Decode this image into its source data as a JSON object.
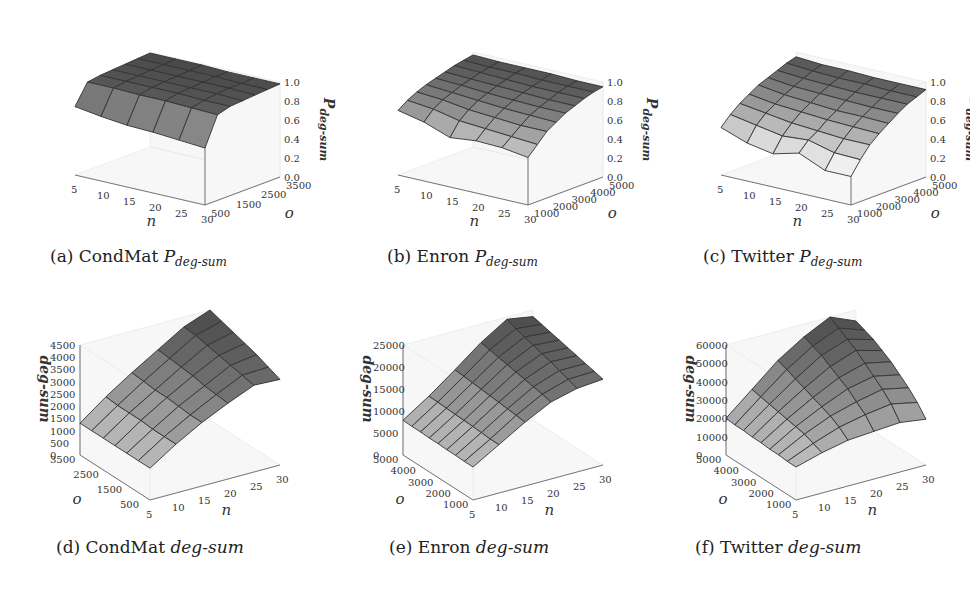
{
  "figure": {
    "panels": [
      {
        "id": "a",
        "caption_prefix": "(a) CondMat ",
        "caption_var": "P",
        "caption_sub": "deg-sum"
      },
      {
        "id": "b",
        "caption_prefix": "(b) Enron ",
        "caption_var": "P",
        "caption_sub": "deg-sum"
      },
      {
        "id": "c",
        "caption_prefix": "(c) Twitter ",
        "caption_var": "P",
        "caption_sub": "deg-sum"
      },
      {
        "id": "d",
        "caption_prefix": "(d) CondMat ",
        "caption_var": "deg-sum",
        "caption_sub": ""
      },
      {
        "id": "e",
        "caption_prefix": "(e) Enron ",
        "caption_var": "deg-sum",
        "caption_sub": ""
      },
      {
        "id": "f",
        "caption_prefix": "(f) Twitter ",
        "caption_var": "deg-sum",
        "caption_sub": ""
      }
    ]
  },
  "chart_data": [
    {
      "type": "surface3d",
      "title": "(a) CondMat P_deg-sum",
      "xlabel": "n",
      "ylabel": "o",
      "zlabel": "P_deg-sum",
      "x_ticks": [
        "5",
        "10",
        "15",
        "20",
        "25",
        "30"
      ],
      "y_ticks": [
        "500",
        "1500",
        "2500",
        "3500"
      ],
      "z_ticks": [
        "0.0",
        "0.2",
        "0.4",
        "0.6",
        "0.8",
        "1.0"
      ],
      "zlim": [
        0,
        1
      ],
      "x": [
        5,
        10,
        15,
        20,
        25,
        30
      ],
      "y": [
        500,
        1000,
        1500,
        2000,
        2500,
        3000,
        3500
      ],
      "z": [
        [
          0.72,
          0.68,
          0.65,
          0.64,
          0.62,
          0.6
        ],
        [
          0.93,
          0.93,
          0.92,
          0.92,
          0.91,
          0.9
        ],
        [
          0.95,
          0.95,
          0.95,
          0.95,
          0.94,
          0.94
        ],
        [
          0.96,
          0.96,
          0.96,
          0.96,
          0.96,
          0.95
        ],
        [
          0.97,
          0.97,
          0.97,
          0.97,
          0.97,
          0.96
        ],
        [
          0.98,
          0.98,
          0.98,
          0.98,
          0.97,
          0.97
        ],
        [
          0.99,
          0.99,
          0.99,
          0.98,
          0.98,
          0.98
        ]
      ]
    },
    {
      "type": "surface3d",
      "title": "(b) Enron P_deg-sum",
      "xlabel": "n",
      "ylabel": "o",
      "zlabel": "P_deg-sum",
      "x_ticks": [
        "5",
        "10",
        "15",
        "20",
        "25",
        "30"
      ],
      "y_ticks": [
        "1000",
        "2000",
        "3000",
        "4000",
        "5000"
      ],
      "z_ticks": [
        "0.0",
        "0.2",
        "0.4",
        "0.6",
        "0.8",
        "1.0"
      ],
      "zlim": [
        0,
        1
      ],
      "x": [
        5,
        10,
        15,
        20,
        25,
        30
      ],
      "y": [
        1000,
        1500,
        2000,
        2500,
        3000,
        3500,
        4000,
        4500,
        5000
      ],
      "z": [
        [
          0.68,
          0.62,
          0.52,
          0.55,
          0.54,
          0.5
        ],
        [
          0.75,
          0.72,
          0.66,
          0.64,
          0.62,
          0.6
        ],
        [
          0.8,
          0.78,
          0.74,
          0.72,
          0.7,
          0.7
        ],
        [
          0.84,
          0.82,
          0.8,
          0.78,
          0.77,
          0.76
        ],
        [
          0.87,
          0.86,
          0.84,
          0.83,
          0.82,
          0.82
        ],
        [
          0.9,
          0.89,
          0.88,
          0.87,
          0.86,
          0.86
        ],
        [
          0.93,
          0.92,
          0.91,
          0.9,
          0.9,
          0.9
        ],
        [
          0.95,
          0.94,
          0.94,
          0.93,
          0.93,
          0.93
        ],
        [
          0.97,
          0.96,
          0.96,
          0.96,
          0.95,
          0.95
        ]
      ]
    },
    {
      "type": "surface3d",
      "title": "(c) Twitter P_deg-sum",
      "xlabel": "n",
      "ylabel": "o",
      "zlabel": "P_deg-sum",
      "x_ticks": [
        "5",
        "10",
        "15",
        "20",
        "25",
        "30"
      ],
      "y_ticks": [
        "1000",
        "2000",
        "3000",
        "4000",
        "5000"
      ],
      "z_ticks": [
        "0.0",
        "0.2",
        "0.4",
        "0.6",
        "0.8",
        "1.0"
      ],
      "zlim": [
        0,
        1
      ],
      "x": [
        5,
        10,
        15,
        20,
        25,
        30
      ],
      "y": [
        1000,
        1500,
        2000,
        2500,
        3000,
        3500,
        4000,
        4500,
        5000
      ],
      "z": [
        [
          0.5,
          0.4,
          0.35,
          0.42,
          0.3,
          0.3
        ],
        [
          0.6,
          0.55,
          0.5,
          0.52,
          0.45,
          0.44
        ],
        [
          0.68,
          0.64,
          0.6,
          0.58,
          0.56,
          0.56
        ],
        [
          0.74,
          0.7,
          0.68,
          0.66,
          0.65,
          0.64
        ],
        [
          0.8,
          0.76,
          0.74,
          0.72,
          0.72,
          0.71
        ],
        [
          0.84,
          0.81,
          0.8,
          0.79,
          0.78,
          0.78
        ],
        [
          0.88,
          0.86,
          0.85,
          0.84,
          0.84,
          0.84
        ],
        [
          0.92,
          0.9,
          0.89,
          0.89,
          0.88,
          0.88
        ],
        [
          0.95,
          0.93,
          0.93,
          0.92,
          0.92,
          0.92
        ]
      ]
    },
    {
      "type": "surface3d",
      "title": "(d) CondMat deg-sum",
      "xlabel": "n",
      "ylabel": "o",
      "zlabel": "deg-sum",
      "x_ticks": [
        "5",
        "10",
        "15",
        "20",
        "25",
        "30"
      ],
      "y_ticks": [
        "500",
        "1500",
        "2500",
        "3500"
      ],
      "z_ticks": [
        "0",
        "500",
        "1000",
        "1500",
        "2000",
        "2500",
        "3000",
        "3500",
        "4000",
        "4500"
      ],
      "zlim": [
        0,
        4500
      ],
      "x": [
        5,
        10,
        15,
        20,
        25,
        30
      ],
      "y": [
        500,
        1000,
        1500,
        2000,
        2500,
        3000,
        3500
      ],
      "z": [
        [
          1300,
          2000,
          2600,
          3100,
          3550,
          3500
        ],
        [
          1300,
          2000,
          2600,
          3150,
          3650,
          3700
        ],
        [
          1300,
          2000,
          2650,
          3200,
          3750,
          3900
        ],
        [
          1300,
          2050,
          2700,
          3300,
          3850,
          4050
        ],
        [
          1300,
          2050,
          2700,
          3350,
          3950,
          4200
        ],
        [
          1300,
          2050,
          2750,
          3400,
          4050,
          4350
        ],
        [
          1300,
          2100,
          2800,
          3450,
          4100,
          4500
        ]
      ]
    },
    {
      "type": "surface3d",
      "title": "(e) Enron deg-sum",
      "xlabel": "n",
      "ylabel": "o",
      "zlabel": "deg-sum",
      "x_ticks": [
        "5",
        "10",
        "15",
        "20",
        "25",
        "30"
      ],
      "y_ticks": [
        "1000",
        "2000",
        "3000",
        "4000",
        "5000"
      ],
      "z_ticks": [
        "0",
        "5000",
        "10000",
        "15000",
        "20000",
        "25000"
      ],
      "zlim": [
        0,
        25000
      ],
      "x": [
        5,
        10,
        15,
        20,
        25,
        30
      ],
      "y": [
        1000,
        1500,
        2000,
        2500,
        3000,
        3500,
        4000,
        4500,
        5000
      ],
      "z": [
        [
          7500,
          11000,
          14500,
          17500,
          19000,
          19500
        ],
        [
          7500,
          11000,
          14800,
          18000,
          19800,
          20000
        ],
        [
          7600,
          11200,
          15000,
          18400,
          20500,
          20500
        ],
        [
          7600,
          11300,
          15200,
          18800,
          21200,
          21000
        ],
        [
          7700,
          11400,
          15400,
          19200,
          21800,
          21500
        ],
        [
          7700,
          11500,
          15600,
          19600,
          22400,
          22000
        ],
        [
          7800,
          11600,
          15800,
          20000,
          23000,
          22500
        ],
        [
          7800,
          11700,
          16000,
          20400,
          23600,
          23000
        ],
        [
          7900,
          11800,
          16200,
          20800,
          24500,
          23500
        ]
      ]
    },
    {
      "type": "surface3d",
      "title": "(f) Twitter deg-sum",
      "xlabel": "n",
      "ylabel": "o",
      "zlabel": "deg-sum",
      "x_ticks": [
        "5",
        "10",
        "15",
        "20",
        "25",
        "30"
      ],
      "y_ticks": [
        "1000",
        "2000",
        "3000",
        "4000",
        "5000"
      ],
      "z_ticks": [
        "0",
        "10000",
        "20000",
        "30000",
        "40000",
        "50000",
        "60000"
      ],
      "zlim": [
        0,
        60000
      ],
      "x": [
        5,
        10,
        15,
        20,
        25,
        30
      ],
      "y": [
        1000,
        1500,
        2000,
        2500,
        3000,
        3500,
        4000,
        4500,
        5000
      ],
      "z": [
        [
          18000,
          22000,
          25000,
          26000,
          27000,
          25000
        ],
        [
          18000,
          24000,
          29000,
          32000,
          34000,
          31000
        ],
        [
          18500,
          26000,
          32000,
          36000,
          39000,
          36000
        ],
        [
          18500,
          27000,
          34000,
          40000,
          43000,
          40000
        ],
        [
          19000,
          28000,
          36000,
          43000,
          47000,
          44000
        ],
        [
          19000,
          29000,
          38000,
          46000,
          51000,
          47000
        ],
        [
          19500,
          30000,
          40000,
          49000,
          54000,
          50000
        ],
        [
          19500,
          31000,
          42000,
          51000,
          57000,
          52000
        ],
        [
          20000,
          32000,
          44000,
          53000,
          60000,
          54000
        ]
      ]
    }
  ]
}
